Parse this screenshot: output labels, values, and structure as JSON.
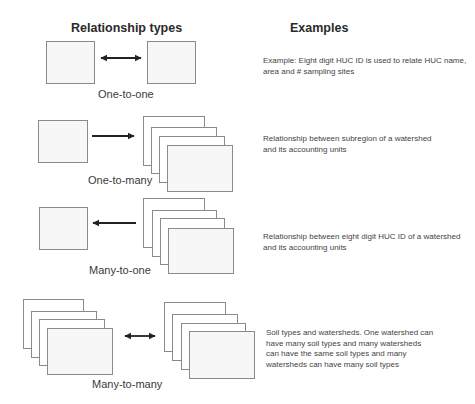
{
  "headings": {
    "relationship_types": "Relationship types",
    "examples": "Examples"
  },
  "relationships": [
    {
      "label": "One-to-one",
      "arrow": "bidirectional",
      "left": "single",
      "right": "single",
      "example": "Example: Eight digit HUC ID is used to relate HUC name, area and # sampling sites"
    },
    {
      "label": "One-to-many",
      "arrow": "right",
      "left": "single",
      "right": "stack",
      "example": "Relationship between subregion of a watershed and its accounting units"
    },
    {
      "label": "Many-to-one",
      "arrow": "left",
      "left": "single",
      "right": "stack",
      "example": "Relationship between eight digit HUC ID of a watershed and its accounting units"
    },
    {
      "label": "Many-to-many",
      "arrow": "bidirectional",
      "left": "stack",
      "right": "stack",
      "example": "Soil types and watersheds. One watershed can have many soil types and many watersheds can have the same soil types and many watersheds can have many soil types"
    }
  ],
  "colors": {
    "box_stroke": "#8a8a8a",
    "box_fill": "#f7f7f7",
    "arrow": "#222222",
    "text": "#333333"
  }
}
